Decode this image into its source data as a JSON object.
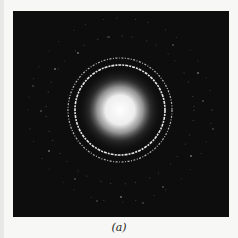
{
  "figure": {
    "caption": "(a)",
    "colors": {
      "background": "#0d0d0d",
      "ring": "#f2f2f2",
      "glow": "#ffffff",
      "page": "#f7f7f5"
    },
    "pattern": {
      "center": [
        107,
        99
      ],
      "central_glow_radius": 26,
      "rings": [
        {
          "name": "inner-bright-ring",
          "radius": 45,
          "width": 1.6,
          "opacity": 0.95
        },
        {
          "name": "outer-bright-ring",
          "radius": 52,
          "width": 1.2,
          "opacity": 0.75
        },
        {
          "name": "faint-ring-1",
          "radius": 74,
          "opacity": 0.35
        },
        {
          "name": "faint-ring-2",
          "radius": 92,
          "opacity": 0.3
        }
      ]
    }
  }
}
